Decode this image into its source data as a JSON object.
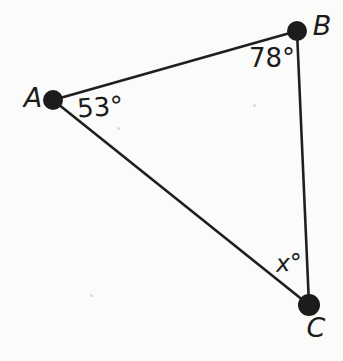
{
  "diagram": {
    "type": "triangle",
    "vertices": [
      {
        "name": "A",
        "angle_label": "53°"
      },
      {
        "name": "B",
        "angle_label": "78°"
      },
      {
        "name": "C",
        "angle_label": "x°"
      }
    ],
    "colors": {
      "ink": "#1f1f1f",
      "background": "#fbfbfa"
    }
  }
}
